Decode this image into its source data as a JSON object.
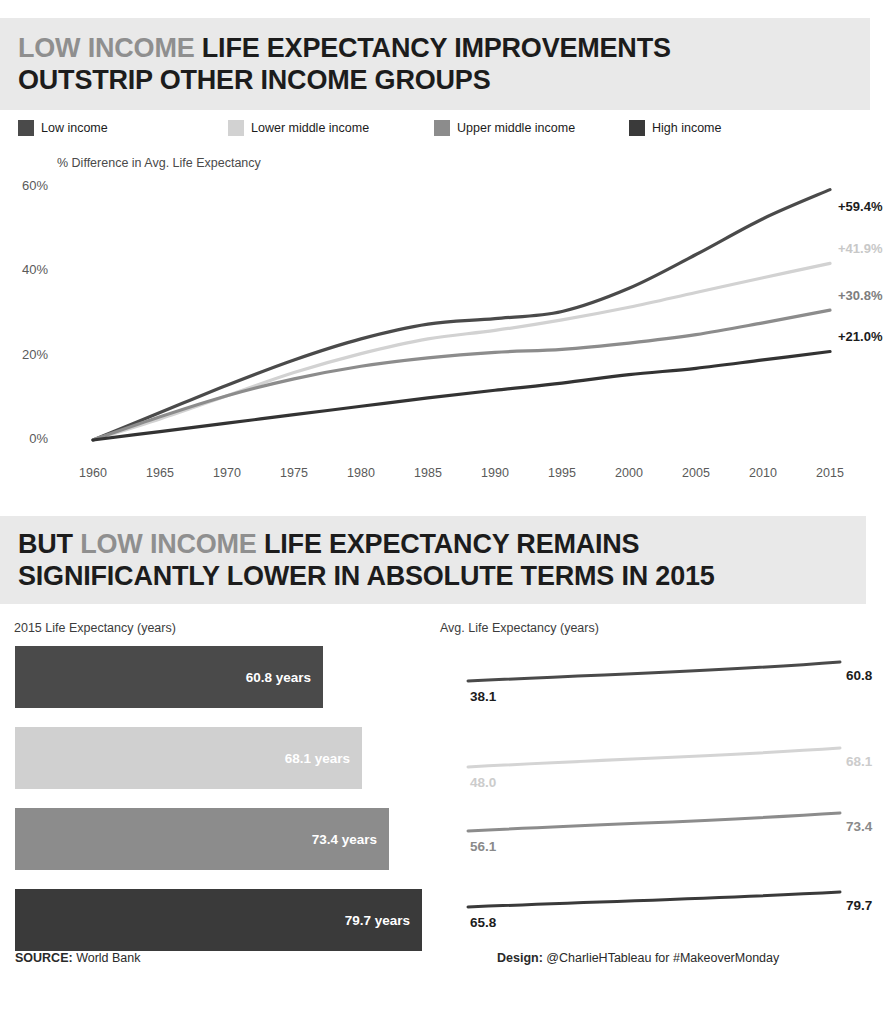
{
  "header": {
    "line1_highlight": "LOW INCOME",
    "line1_rest": "LIFE EXPECTANCY IMPROVEMENTS",
    "line2": "OUTSTRIP OTHER INCOME GROUPS"
  },
  "header2": {
    "prefix": "BUT ",
    "highlight": "LOW INCOME",
    "rest": " LIFE EXPECTANCY REMAINS",
    "line2": "SIGNIFICANTLY LOWER IN ABSOLUTE TERMS IN 2015"
  },
  "legend": {
    "items": [
      {
        "label": "Low income",
        "color": "#4a4a4a",
        "x": 18
      },
      {
        "label": "Lower middle income",
        "color": "#d2d2d2",
        "x": 228
      },
      {
        "label": "Upper middle income",
        "color": "#8c8c8c",
        "x": 434
      },
      {
        "label": "High income",
        "color": "#3a3a3a",
        "x": 629
      }
    ]
  },
  "colors": {
    "low_income": "#4a4a4a",
    "lower_middle": "#d2d2d2",
    "upper_middle": "#8c8c8c",
    "high_income": "#333333",
    "banner_bg": "#e9e9e9",
    "text_dark": "#1c1c1c",
    "text_grey": "#8f8f8f"
  },
  "chart_data": [
    {
      "type": "line",
      "id": "pct-difference-line-chart",
      "title": "% Difference in Avg. Life Expectancy",
      "xlabel": "",
      "ylabel": "% Difference in Avg. Life Expectancy",
      "ylim": [
        0,
        60
      ],
      "xlim": [
        1960,
        2015
      ],
      "grid": false,
      "legend_position": "top",
      "y_ticks": [
        "0%",
        "20%",
        "40%",
        "60%"
      ],
      "y_tick_values": [
        0,
        20,
        40,
        60
      ],
      "x_ticks": [
        "1960",
        "1965",
        "1970",
        "1975",
        "1980",
        "1985",
        "1990",
        "1995",
        "2000",
        "2005",
        "2010",
        "2015"
      ],
      "x": [
        1960,
        1965,
        1970,
        1975,
        1980,
        1985,
        1990,
        1995,
        2000,
        2005,
        2010,
        2015
      ],
      "series": [
        {
          "name": "Low income",
          "color": "#4a4a4a",
          "end_label": "+59.4%",
          "end_label_color": "#1c1c1c",
          "values": [
            0,
            6.5,
            13.0,
            19.0,
            24.0,
            27.5,
            28.8,
            30.5,
            36.0,
            44.0,
            52.5,
            59.4
          ]
        },
        {
          "name": "Lower middle income",
          "color": "#d2d2d2",
          "end_label": "+41.9%",
          "end_label_color": "#c8c8c8",
          "values": [
            0,
            5.0,
            10.5,
            16.0,
            20.5,
            24.0,
            26.0,
            28.5,
            31.5,
            35.0,
            38.5,
            41.9
          ]
        },
        {
          "name": "Upper middle income",
          "color": "#8c8c8c",
          "end_label": "+30.8%",
          "end_label_color": "#7d7d7d",
          "values": [
            0,
            5.5,
            10.5,
            14.5,
            17.5,
            19.5,
            20.8,
            21.5,
            23.0,
            25.0,
            27.8,
            30.8
          ]
        },
        {
          "name": "High income",
          "color": "#333333",
          "end_label": "+21.0%",
          "end_label_color": "#1c1c1c",
          "values": [
            0,
            2.0,
            4.0,
            6.0,
            8.0,
            10.0,
            11.8,
            13.5,
            15.5,
            17.0,
            19.0,
            21.0
          ]
        }
      ]
    },
    {
      "type": "bar",
      "id": "life-expectancy-2015-bar-chart",
      "title": "2015 Life Expectancy (years)",
      "orientation": "horizontal",
      "xlabel": "",
      "ylabel": "",
      "xlim": [
        0,
        84
      ],
      "grid": false,
      "categories": [
        "Low income",
        "Lower middle income",
        "Upper middle income",
        "High income"
      ],
      "values": [
        60.8,
        68.1,
        73.4,
        79.7
      ],
      "value_labels": [
        "60.8 years",
        "68.1 years",
        "73.4 years",
        "79.7 years"
      ],
      "colors": [
        "#4a4a4a",
        "#d0d0d0",
        "#8c8c8c",
        "#3a3a3a"
      ],
      "bar_widths_px": [
        308,
        347,
        374,
        407
      ],
      "bar_tops_px": [
        31,
        112,
        193,
        274
      ]
    },
    {
      "type": "line",
      "id": "avg-life-expectancy-slope-chart",
      "title": "Avg. Life Expectancy (years)",
      "xlabel": "",
      "ylabel": "",
      "grid": false,
      "x": [
        1960,
        2015
      ],
      "series": [
        {
          "name": "Low income",
          "color": "#4a4a4a",
          "values": [
            38.1,
            60.8
          ],
          "start_label": "38.1",
          "end_label": "60.8",
          "label_color": "#1c1c1c",
          "y_start_px": 66,
          "y_end_px": 47
        },
        {
          "name": "Lower middle income",
          "color": "#d4d4d4",
          "values": [
            48.0,
            68.1
          ],
          "start_label": "48.0",
          "end_label": "68.1",
          "label_color": "#cccccc",
          "y_start_px": 152,
          "y_end_px": 133
        },
        {
          "name": "Upper middle income",
          "color": "#8c8c8c",
          "values": [
            56.1,
            73.4
          ],
          "start_label": "56.1",
          "end_label": "73.4",
          "label_color": "#8a8a8a",
          "y_start_px": 216,
          "y_end_px": 198
        },
        {
          "name": "High income",
          "color": "#3a3a3a",
          "values": [
            65.8,
            79.7
          ],
          "start_label": "65.8",
          "end_label": "79.7",
          "label_color": "#1c1c1c",
          "y_start_px": 292,
          "y_end_px": 277
        }
      ]
    }
  ],
  "footer": {
    "source_label": "SOURCE:",
    "source_value": " World Bank",
    "design_label": "Design:",
    "design_value": " @CharlieHTableau for #MakeoverMonday"
  }
}
